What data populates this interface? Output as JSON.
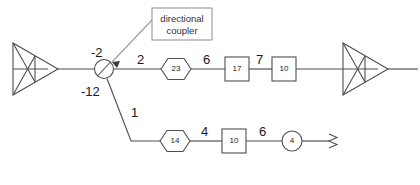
{
  "figure": {
    "background_color": "#ffffff",
    "line_color": "#4e4e52",
    "text_color": "#1a1a1a"
  },
  "callout": {
    "line1": "directional",
    "line2": "coupler",
    "border_color": "#8d8d93"
  },
  "coupler": {
    "through_label": "-2",
    "coupled_label": "-12",
    "symbol": "directional-coupler-circle"
  },
  "upper_branch": {
    "path_labels": [
      "2",
      "6",
      "7"
    ],
    "components": [
      {
        "shape": "hexagon",
        "value": "23"
      },
      {
        "shape": "rect",
        "value": "17"
      },
      {
        "shape": "rect",
        "value": "10"
      }
    ],
    "source_symbol": "antenna-triangle-left",
    "sink_symbol": "antenna-triangle-right"
  },
  "lower_branch": {
    "branch_label": "1",
    "path_labels": [
      "4",
      "6"
    ],
    "components": [
      {
        "shape": "hexagon",
        "value": "14"
      },
      {
        "shape": "rect",
        "value": "10"
      },
      {
        "shape": "circle",
        "value": "4"
      }
    ],
    "termination_symbol": "zigzag-termination"
  }
}
